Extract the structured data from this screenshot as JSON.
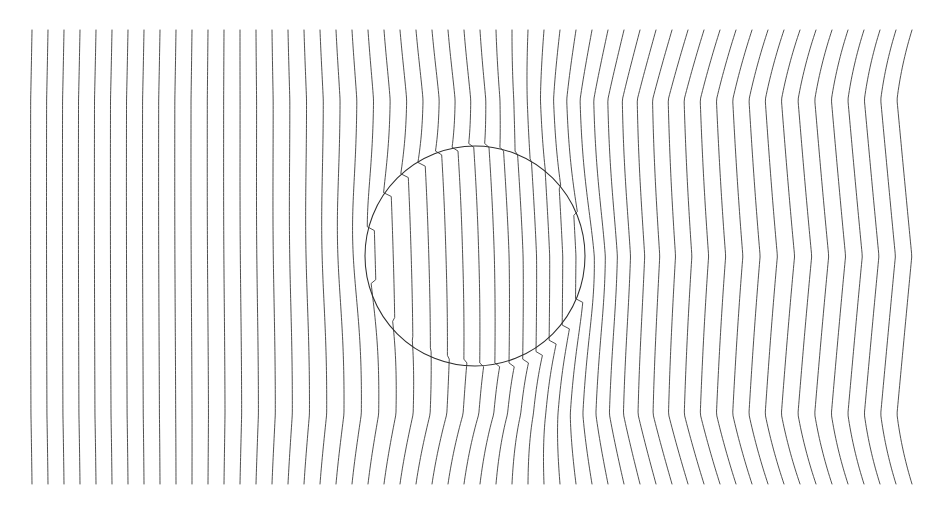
{
  "figure": {
    "title": "",
    "background_color": "#ffffff",
    "width": 939,
    "height": 509
  },
  "chart_data": {
    "type": "line",
    "title": "",
    "subtitle": "",
    "xlabel": "",
    "ylabel": "",
    "grid": false,
    "legend": null,
    "annotations": [],
    "plot_area": {
      "x_min": 32,
      "x_max": 912,
      "y_min": 30,
      "y_max": 484
    },
    "xlim": [
      32,
      912
    ],
    "ylim": [
      30,
      484
    ],
    "stroke_color": "#3b3b3b",
    "stroke_width": 0.9,
    "streamlines": {
      "count": 56,
      "x_start_left": 32,
      "x_start_right": 912,
      "uniform_spacing": 16.0,
      "y_top": 30,
      "y_bottom": 484,
      "sample_points_per_line": 120
    },
    "obstacle": {
      "shape": "circle",
      "center_x": 475,
      "center_y": 256,
      "radius": 110,
      "stroke_color": "#2e2e2e",
      "stroke_width": 1.05,
      "fill": "none",
      "bounds": {
        "left": 365,
        "right": 585,
        "top": 146,
        "bottom": 366
      }
    },
    "field_model": {
      "name": "dipole-refraction",
      "interior_contrast": 0.62,
      "exterior_strength": 0.98,
      "downstream_shift_x": 62,
      "downstream_shift_y": 10,
      "vertical_shear": 0.52,
      "compression_gain": 1.35,
      "tilt_upper_right_deg": 11,
      "tilt_lower_right_deg": -11
    },
    "series": [
      {
        "name": "streamlines",
        "values": []
      }
    ]
  }
}
